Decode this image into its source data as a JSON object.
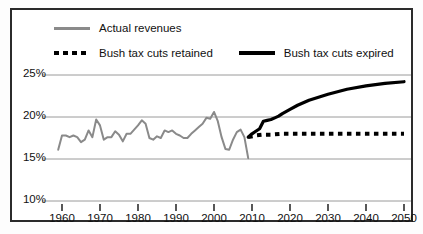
{
  "chart_data": {
    "type": "line",
    "title": "",
    "subtitle": "",
    "xlabel": "",
    "ylabel": "",
    "xlim": [
      1955,
      2053
    ],
    "ylim": [
      10,
      26.5
    ],
    "grid": true,
    "gridlines_y": [
      15,
      20,
      25
    ],
    "legend_position": "top",
    "y_tick_labels": [
      "25%",
      "20%",
      "15%",
      "10%"
    ],
    "y_ticks": [
      25,
      20,
      15,
      10
    ],
    "x_ticks": [
      1960,
      1970,
      1980,
      1990,
      2000,
      2010,
      2020,
      2030,
      2040,
      2050
    ],
    "x_tick_labels": [
      "1960",
      "1970",
      "1980",
      "1990",
      "2000",
      "2010",
      "2020",
      "2030",
      "2040",
      "2050"
    ],
    "series": [
      {
        "name": "Actual revenues",
        "style": "solid",
        "color": "#8a8a8a",
        "x": [
          1959,
          1960,
          1961,
          1962,
          1963,
          1964,
          1965,
          1966,
          1967,
          1968,
          1969,
          1970,
          1971,
          1972,
          1973,
          1974,
          1975,
          1976,
          1977,
          1978,
          1979,
          1980,
          1981,
          1982,
          1983,
          1984,
          1985,
          1986,
          1987,
          1988,
          1989,
          1990,
          1991,
          1992,
          1993,
          1994,
          1995,
          1996,
          1997,
          1998,
          1999,
          2000,
          2001,
          2002,
          2003,
          2004,
          2005,
          2006,
          2007,
          2008,
          2009
        ],
        "values": [
          16.1,
          17.8,
          17.8,
          17.6,
          17.8,
          17.6,
          17.0,
          17.3,
          18.4,
          17.6,
          19.7,
          19.0,
          17.3,
          17.6,
          17.6,
          18.3,
          17.9,
          17.1,
          18.0,
          18.0,
          18.5,
          19.0,
          19.6,
          19.2,
          17.5,
          17.3,
          17.7,
          17.5,
          18.4,
          18.2,
          18.4,
          18.0,
          17.8,
          17.5,
          17.5,
          18.0,
          18.4,
          18.8,
          19.2,
          19.9,
          19.8,
          20.6,
          19.5,
          17.6,
          16.2,
          16.1,
          17.3,
          18.2,
          18.5,
          17.6,
          15.1
        ]
      },
      {
        "name": "Bush tax cuts expired",
        "style": "solid",
        "color": "#000000",
        "x": [
          2009,
          2010,
          2011,
          2012,
          2013,
          2014,
          2015,
          2016,
          2017,
          2018,
          2020,
          2022,
          2025,
          2030,
          2035,
          2040,
          2045,
          2050
        ],
        "values": [
          17.6,
          18.0,
          18.3,
          18.6,
          19.5,
          19.6,
          19.7,
          19.9,
          20.1,
          20.4,
          20.9,
          21.4,
          22.0,
          22.7,
          23.3,
          23.7,
          24.0,
          24.2
        ]
      },
      {
        "name": "Bush tax cuts retained",
        "style": "dotted",
        "color": "#000000",
        "x": [
          2009,
          2011,
          2013,
          2015,
          2018,
          2020,
          2025,
          2030,
          2035,
          2040,
          2045,
          2050
        ],
        "values": [
          17.6,
          17.8,
          17.9,
          17.9,
          18.0,
          18.0,
          18.0,
          18.0,
          18.0,
          18.0,
          18.0,
          18.0
        ]
      }
    ]
  },
  "legend": {
    "row1": [
      {
        "label": "Actual revenues",
        "swatch": "solid-gray-line-icon"
      }
    ],
    "row2": [
      {
        "label": "Bush tax cuts retained",
        "swatch": "dotted-black-line-icon"
      },
      {
        "label": "Bush tax cuts expired",
        "swatch": "solid-black-line-icon"
      }
    ]
  },
  "colors": {
    "actual": "#8a8a8a",
    "projection": "#000000",
    "grid": "#9a9a9a",
    "border": "#2b2b2b",
    "background": "#ffffff"
  }
}
